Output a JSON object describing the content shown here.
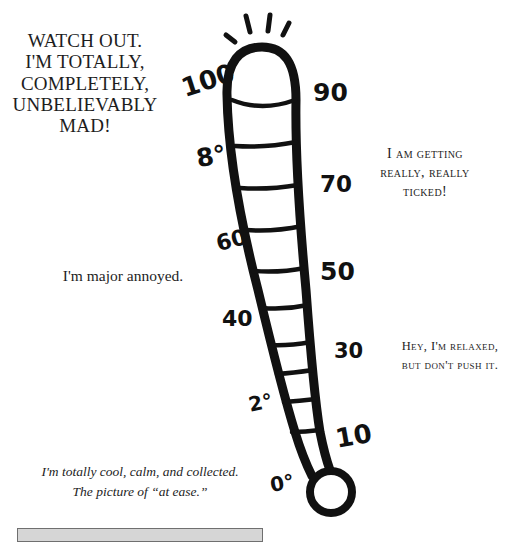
{
  "captions": {
    "mad": [
      "WATCH OUT.",
      "I'M TOTALLY,",
      "COMPLETELY,",
      "UNBELIEVABLY",
      "MAD!"
    ],
    "ticked": [
      "I am getting",
      "really, really",
      "ticked!"
    ],
    "annoyed": "I'm major annoyed.",
    "relaxed": [
      "Hey, I'm relaxed,",
      "but don't push it."
    ],
    "cool": [
      "I'm totally cool, calm, and collected.",
      "The picture of “at ease.”"
    ]
  },
  "thermometer": {
    "scale_labels": {
      "l100": "100",
      "l90": "90",
      "l80": "8°",
      "l70": "70",
      "l60": "60",
      "l50": "50",
      "l40": "40",
      "l30": "30",
      "l20": "2°",
      "l10": "10",
      "l0": "0°"
    }
  },
  "colors": {
    "ink": "#111111",
    "text": "#1d1d1d",
    "box_fill": "#d6d6d6",
    "box_border": "#6f6f6f"
  }
}
